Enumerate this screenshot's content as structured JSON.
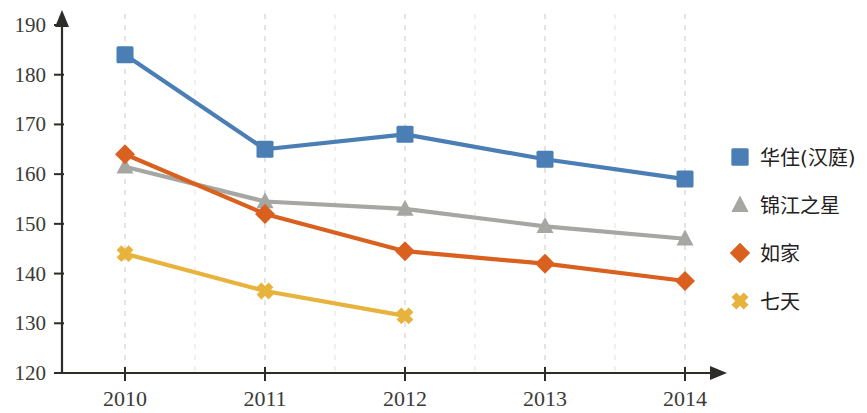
{
  "chart_data": {
    "type": "line",
    "title": "",
    "subtitle": "",
    "xlabel": "",
    "ylabel": "",
    "categories": [
      "2010",
      "2011",
      "2012",
      "2013",
      "2014"
    ],
    "xlim": [
      2010,
      2014
    ],
    "ylim": [
      120,
      190
    ],
    "y_ticks": [
      120,
      130,
      140,
      150,
      160,
      170,
      180,
      190
    ],
    "x_ticks": [
      "2010",
      "2011",
      "2012",
      "2013",
      "2014"
    ],
    "grid": "vertical-dashed",
    "legend_position": "right",
    "series": [
      {
        "name": "华住(汉庭)",
        "marker": "square",
        "color": "#4a7eb5",
        "values": [
          184,
          165,
          168,
          163,
          159
        ]
      },
      {
        "name": "锦江之星",
        "marker": "triangle",
        "color": "#a6a6a2",
        "values": [
          161.5,
          154.5,
          153,
          149.5,
          147
        ]
      },
      {
        "name": "如家",
        "marker": "diamond",
        "color": "#d9601f",
        "values": [
          164,
          152,
          144.5,
          142,
          138.5
        ]
      },
      {
        "name": "七天",
        "marker": "cross",
        "color": "#e8b33c",
        "values": [
          144,
          136.5,
          131.5,
          null,
          null
        ]
      }
    ]
  },
  "axis": {
    "y_tick_labels": [
      "190",
      "180",
      "170",
      "160",
      "150",
      "140",
      "130",
      "120"
    ],
    "x_tick_labels": [
      "2010",
      "2011",
      "2012",
      "2013",
      "2014"
    ]
  },
  "legend": {
    "items": [
      {
        "label": "华住(汉庭)",
        "marker": "square-marker-icon",
        "color": "#4a7eb5"
      },
      {
        "label": "锦江之星",
        "marker": "triangle-marker-icon",
        "color": "#a6a6a2"
      },
      {
        "label": "如家",
        "marker": "diamond-marker-icon",
        "color": "#d9601f"
      },
      {
        "label": "七天",
        "marker": "cross-marker-icon",
        "color": "#e8b33c"
      }
    ]
  }
}
